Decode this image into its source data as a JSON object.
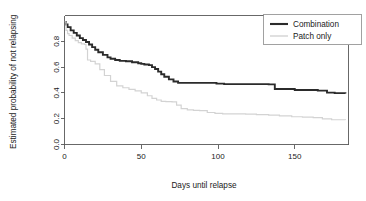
{
  "chart_data": {
    "type": "line",
    "title": "",
    "subtitle": "",
    "xlabel": "Days until relapse",
    "ylabel": "Estimated probability of not relapsing",
    "xlim": [
      0,
      185
    ],
    "ylim": [
      0.0,
      1.0
    ],
    "xticks": [
      0,
      50,
      100,
      150
    ],
    "xtick_labels": [
      "0",
      "50",
      "100",
      "150"
    ],
    "yticks": [
      0.0,
      0.2,
      0.4,
      0.6,
      0.8
    ],
    "ytick_labels": [
      "0.0",
      "0.2",
      "0.4",
      "0.6",
      "0.8"
    ],
    "grid": false,
    "step_style": "post",
    "legend_position": "top-right",
    "legend_entries": [
      "Combination",
      "Patch only"
    ],
    "series": [
      {
        "name": "Combination",
        "color": "#2b2b2b",
        "line_width": 1.9,
        "x": [
          0,
          1,
          2,
          4,
          6,
          8,
          10,
          12,
          14,
          16,
          18,
          20,
          22,
          25,
          28,
          30,
          33,
          36,
          40,
          44,
          48,
          50,
          52,
          55,
          57,
          59,
          61,
          63,
          65,
          68,
          71,
          74,
          78,
          85,
          95,
          99,
          104,
          120,
          133,
          137,
          150,
          165,
          171,
          176,
          183
        ],
        "y": [
          0.95,
          0.93,
          0.91,
          0.885,
          0.865,
          0.845,
          0.825,
          0.81,
          0.795,
          0.775,
          0.755,
          0.735,
          0.715,
          0.695,
          0.675,
          0.665,
          0.655,
          0.648,
          0.645,
          0.638,
          0.63,
          0.625,
          0.62,
          0.615,
          0.6,
          0.585,
          0.565,
          0.545,
          0.525,
          0.505,
          0.488,
          0.478,
          0.478,
          0.478,
          0.478,
          0.472,
          0.468,
          0.468,
          0.466,
          0.43,
          0.422,
          0.418,
          0.402,
          0.398,
          0.395
        ]
      },
      {
        "name": "Patch only",
        "color": "#d3d3d3",
        "line_width": 1.2,
        "x": [
          0,
          1,
          2,
          3,
          5,
          7,
          9,
          11,
          13,
          14,
          15,
          17,
          20,
          23,
          26,
          30,
          34,
          38,
          42,
          46,
          50,
          54,
          57,
          60,
          63,
          66,
          70,
          73,
          76,
          80,
          84,
          88,
          93,
          98,
          103,
          110,
          118,
          125,
          133,
          140,
          148,
          155,
          162,
          168,
          174,
          183
        ],
        "y": [
          0.95,
          0.885,
          0.86,
          0.845,
          0.825,
          0.805,
          0.79,
          0.78,
          0.775,
          0.74,
          0.655,
          0.645,
          0.625,
          0.58,
          0.535,
          0.49,
          0.455,
          0.44,
          0.428,
          0.415,
          0.4,
          0.378,
          0.358,
          0.345,
          0.335,
          0.332,
          0.33,
          0.305,
          0.278,
          0.268,
          0.265,
          0.262,
          0.248,
          0.242,
          0.238,
          0.238,
          0.235,
          0.232,
          0.228,
          0.222,
          0.215,
          0.212,
          0.208,
          0.198,
          0.192,
          0.19
        ]
      }
    ]
  },
  "axes": {
    "y_title": "Estimated probability of not relapsing",
    "x_title": "Days until relapse"
  },
  "legend": {
    "items": [
      {
        "label": "Combination",
        "color": "#2b2b2b"
      },
      {
        "label": "Patch only",
        "color": "#d3d3d3"
      }
    ]
  },
  "colors": {
    "combination": "#2b2b2b",
    "patch_only": "#d3d3d3",
    "frame": "#585858",
    "background": "#ffffff"
  }
}
